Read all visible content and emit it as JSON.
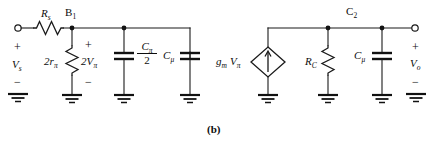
{
  "figure": {
    "caption": "(b)",
    "background_color": "#ffffff",
    "ink_color": "#111111"
  },
  "input_stage": {
    "source_label_html": "V<sub>s</sub>",
    "source_plus": "+",
    "source_minus": "−",
    "series_resistor_html": "R<sub>s</sub>",
    "base_node_html": "B<sub>1</sub>",
    "shunt_resistor_html": "2r<sub>π</sub>",
    "shunt_voltage_html": "2V<sub>π</sub>",
    "shunt_voltage_plus": "+",
    "shunt_voltage_minus": "−",
    "cap_pi_numerator_html": "C<sub>π</sub>",
    "cap_pi_denominator": "2",
    "cap_mu_html": "C<sub>μ</sub>"
  },
  "output_stage": {
    "dependent_source_html": "g<sub>m</sub> V<sub>π</sub>",
    "collector_resistor_html": "R<sub>C</sub>",
    "cap_mu_html": "C<sub>μ</sub>",
    "node_label_html": "C<sub>2</sub>",
    "output_label_html": "V<sub>o</sub>",
    "output_plus": "+",
    "output_minus": "−"
  },
  "icons": {
    "ground": "ground-symbol",
    "resistor": "zigzag-resistor",
    "capacitor": "parallel-plate-capacitor",
    "current_source": "diamond-current-source",
    "terminal": "open-circle-terminal"
  }
}
